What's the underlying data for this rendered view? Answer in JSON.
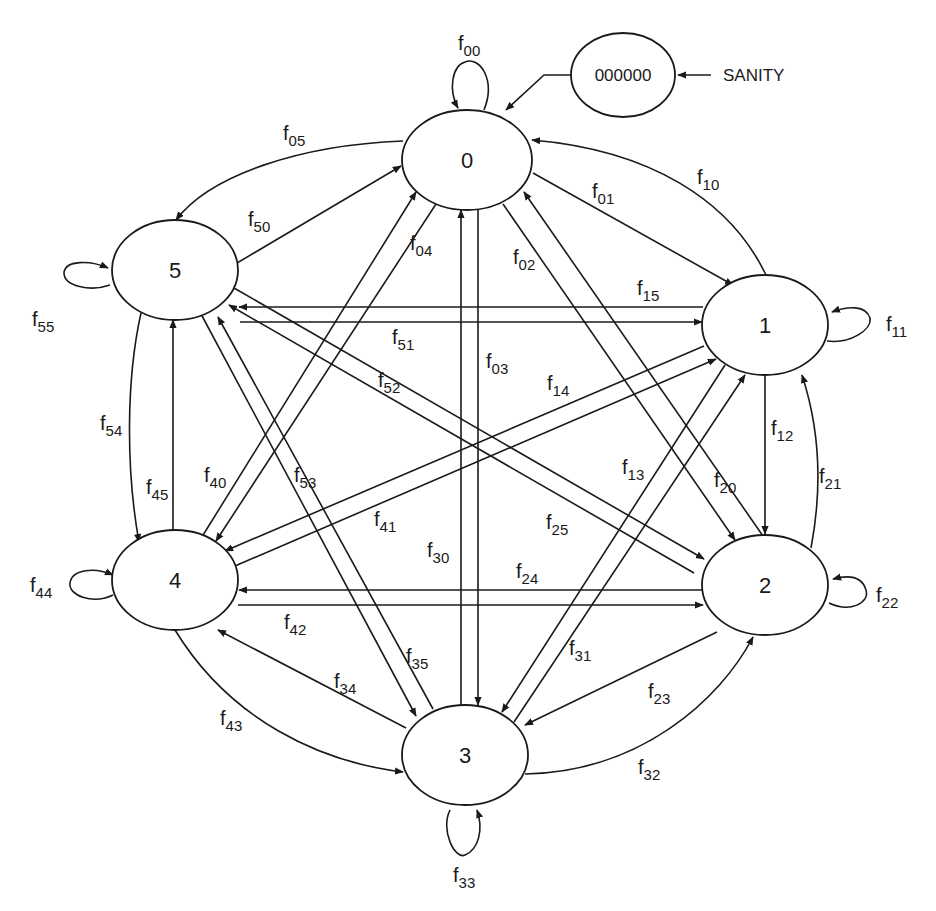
{
  "diagram": {
    "colors": {
      "stroke": "#1a1a1a",
      "background": "#ffffff"
    },
    "sanity": {
      "value": "000000",
      "input_label": "SANITY"
    },
    "states": [
      {
        "id": "0",
        "label": "0",
        "cx": 467,
        "cy": 160
      },
      {
        "id": "1",
        "label": "1",
        "cx": 765,
        "cy": 325
      },
      {
        "id": "2",
        "label": "2",
        "cx": 765,
        "cy": 585
      },
      {
        "id": "3",
        "label": "3",
        "cx": 465,
        "cy": 755
      },
      {
        "id": "4",
        "label": "4",
        "cx": 175,
        "cy": 580
      },
      {
        "id": "5",
        "label": "5",
        "cx": 175,
        "cy": 270
      }
    ],
    "edges": [
      {
        "from": "0",
        "to": "0",
        "label": "f",
        "sub": "00"
      },
      {
        "from": "0",
        "to": "1",
        "label": "f",
        "sub": "01"
      },
      {
        "from": "0",
        "to": "2",
        "label": "f",
        "sub": "02"
      },
      {
        "from": "0",
        "to": "3",
        "label": "f",
        "sub": "03"
      },
      {
        "from": "0",
        "to": "4",
        "label": "f",
        "sub": "04"
      },
      {
        "from": "0",
        "to": "5",
        "label": "f",
        "sub": "05"
      },
      {
        "from": "1",
        "to": "0",
        "label": "f",
        "sub": "10"
      },
      {
        "from": "1",
        "to": "1",
        "label": "f",
        "sub": "11"
      },
      {
        "from": "1",
        "to": "2",
        "label": "f",
        "sub": "12"
      },
      {
        "from": "1",
        "to": "3",
        "label": "f",
        "sub": "13"
      },
      {
        "from": "1",
        "to": "4",
        "label": "f",
        "sub": "14"
      },
      {
        "from": "1",
        "to": "5",
        "label": "f",
        "sub": "15"
      },
      {
        "from": "2",
        "to": "0",
        "label": "f",
        "sub": "20"
      },
      {
        "from": "2",
        "to": "1",
        "label": "f",
        "sub": "21"
      },
      {
        "from": "2",
        "to": "2",
        "label": "f",
        "sub": "22"
      },
      {
        "from": "2",
        "to": "3",
        "label": "f",
        "sub": "23"
      },
      {
        "from": "2",
        "to": "4",
        "label": "f",
        "sub": "24"
      },
      {
        "from": "2",
        "to": "5",
        "label": "f",
        "sub": "25"
      },
      {
        "from": "3",
        "to": "0",
        "label": "f",
        "sub": "30"
      },
      {
        "from": "3",
        "to": "1",
        "label": "f",
        "sub": "31"
      },
      {
        "from": "3",
        "to": "2",
        "label": "f",
        "sub": "32"
      },
      {
        "from": "3",
        "to": "3",
        "label": "f",
        "sub": "33"
      },
      {
        "from": "3",
        "to": "4",
        "label": "f",
        "sub": "34"
      },
      {
        "from": "3",
        "to": "5",
        "label": "f",
        "sub": "35"
      },
      {
        "from": "4",
        "to": "0",
        "label": "f",
        "sub": "40"
      },
      {
        "from": "4",
        "to": "1",
        "label": "f",
        "sub": "41"
      },
      {
        "from": "4",
        "to": "2",
        "label": "f",
        "sub": "42"
      },
      {
        "from": "4",
        "to": "3",
        "label": "f",
        "sub": "43"
      },
      {
        "from": "4",
        "to": "4",
        "label": "f",
        "sub": "44"
      },
      {
        "from": "4",
        "to": "5",
        "label": "f",
        "sub": "45"
      },
      {
        "from": "5",
        "to": "0",
        "label": "f",
        "sub": "50"
      },
      {
        "from": "5",
        "to": "1",
        "label": "f",
        "sub": "51"
      },
      {
        "from": "5",
        "to": "2",
        "label": "f",
        "sub": "52"
      },
      {
        "from": "5",
        "to": "3",
        "label": "f",
        "sub": "53"
      },
      {
        "from": "5",
        "to": "4",
        "label": "f",
        "sub": "54"
      },
      {
        "from": "5",
        "to": "5",
        "label": "f",
        "sub": "55"
      }
    ]
  }
}
